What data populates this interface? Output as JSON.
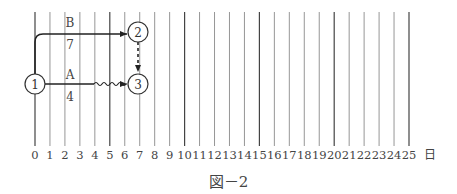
{
  "diagram": {
    "type": "arrow-network-timescale",
    "caption": "図－2",
    "axis": {
      "unit_label": "日",
      "ticks": [
        "0",
        "1",
        "2",
        "3",
        "4",
        "5",
        "6",
        "7",
        "8",
        "9",
        "10",
        "11",
        "12",
        "13",
        "14",
        "15",
        "16",
        "17",
        "18",
        "19",
        "20",
        "21",
        "22",
        "23",
        "24",
        "25"
      ]
    },
    "nodes": [
      {
        "id": "1",
        "label": "1",
        "day": 0
      },
      {
        "id": "2",
        "label": "2",
        "day": 7
      },
      {
        "id": "3",
        "label": "3",
        "day": 7
      }
    ],
    "activities": [
      {
        "name": "B",
        "duration": "7",
        "from": "1",
        "to": "2",
        "style": "solid"
      },
      {
        "name": "A",
        "duration": "4",
        "from": "1",
        "to": "3",
        "style": "solid+float",
        "float_days": 3
      },
      {
        "name": "dummy",
        "from": "2",
        "to": "3",
        "style": "dashed"
      }
    ]
  }
}
